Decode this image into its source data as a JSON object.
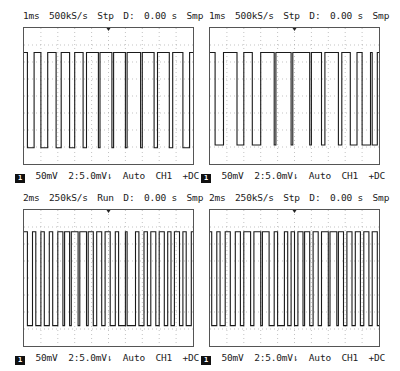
{
  "panels": [
    {
      "id": "top-left",
      "header": {
        "timebase": "1ms",
        "sample_rate": "500kS/s",
        "state": "Stp",
        "delay_label": "D:",
        "delay": "0.00 s",
        "mode": "Smp"
      },
      "footer": {
        "channel_badge": "1",
        "volts_div": "50mV",
        "trigger_level": "2:5.0mV",
        "trigger_icon": "rising-edge",
        "trigger_mode": "Auto",
        "trigger_source": "CH1",
        "coupling": "+DC"
      },
      "waveform": {
        "high_y": 0.18,
        "low_y": 0.88,
        "edges": [
          0.02,
          0.06,
          0.1,
          0.14,
          0.19,
          0.22,
          0.27,
          0.3,
          0.35,
          0.37,
          0.44,
          0.45,
          0.52,
          0.53,
          0.6,
          0.61,
          0.69,
          0.7,
          0.77,
          0.79,
          0.86,
          0.88,
          0.94,
          0.98
        ]
      }
    },
    {
      "id": "top-right",
      "header": {
        "timebase": "1ms",
        "sample_rate": "500kS/s",
        "state": "Stp",
        "delay_label": "D:",
        "delay": "0.00 s",
        "mode": "Smp"
      },
      "footer": {
        "channel_badge": "1",
        "volts_div": "50mV",
        "trigger_level": "2:5.0mV",
        "trigger_icon": "rising-edge",
        "trigger_mode": "Auto",
        "trigger_source": "CH1",
        "coupling": "+DC"
      },
      "waveform": {
        "high_y": 0.18,
        "low_y": 0.86,
        "edges": [
          0.03,
          0.08,
          0.16,
          0.2,
          0.25,
          0.3,
          0.38,
          0.39,
          0.48,
          0.49,
          0.59,
          0.6,
          0.66,
          0.68,
          0.76,
          0.78,
          0.83,
          0.87,
          0.9,
          0.95,
          0.96,
          0.99
        ]
      }
    },
    {
      "id": "bottom-left",
      "header": {
        "timebase": "2ms",
        "sample_rate": "250kS/s",
        "state": "Run",
        "delay_label": "D:",
        "delay": "0.00 s",
        "mode": "Smp"
      },
      "footer": {
        "channel_badge": "1",
        "volts_div": "50mV",
        "trigger_level": "2:5.0mV",
        "trigger_icon": "rising-edge",
        "trigger_mode": "Auto",
        "trigger_source": "CH1",
        "coupling": "+DC"
      },
      "waveform": {
        "high_y": 0.16,
        "low_y": 0.85,
        "edges": [
          0.02,
          0.05,
          0.07,
          0.1,
          0.12,
          0.15,
          0.17,
          0.2,
          0.23,
          0.24,
          0.27,
          0.28,
          0.32,
          0.33,
          0.37,
          0.38,
          0.41,
          0.43,
          0.46,
          0.48,
          0.51,
          0.54,
          0.56,
          0.6,
          0.61,
          0.66,
          0.68,
          0.71,
          0.73,
          0.75,
          0.78,
          0.8,
          0.83,
          0.85,
          0.87,
          0.89,
          0.92,
          0.94,
          0.96,
          0.99
        ]
      }
    },
    {
      "id": "bottom-right",
      "header": {
        "timebase": "2ms",
        "sample_rate": "250kS/s",
        "state": "Stp",
        "delay_label": "D:",
        "delay": "0.00 s",
        "mode": "Smp"
      },
      "footer": {
        "channel_badge": "1",
        "volts_div": "50mV",
        "trigger_level": "2:5.0mV",
        "trigger_icon": "rising-edge",
        "trigger_mode": "Auto",
        "trigger_source": "CH1",
        "coupling": "+DC"
      },
      "waveform": {
        "high_y": 0.16,
        "low_y": 0.85,
        "edges": [
          0.01,
          0.04,
          0.06,
          0.09,
          0.12,
          0.15,
          0.18,
          0.2,
          0.24,
          0.26,
          0.3,
          0.31,
          0.35,
          0.38,
          0.4,
          0.44,
          0.46,
          0.48,
          0.5,
          0.52,
          0.55,
          0.56,
          0.59,
          0.61,
          0.64,
          0.66,
          0.7,
          0.71,
          0.75,
          0.76,
          0.79,
          0.81,
          0.84,
          0.86,
          0.89,
          0.91,
          0.94,
          0.96,
          0.99
        ]
      }
    }
  ],
  "colors": {
    "trace": "#1a1a1a",
    "grid": "#9a9a9a",
    "frame": "#555555",
    "background": "#ffffff"
  }
}
